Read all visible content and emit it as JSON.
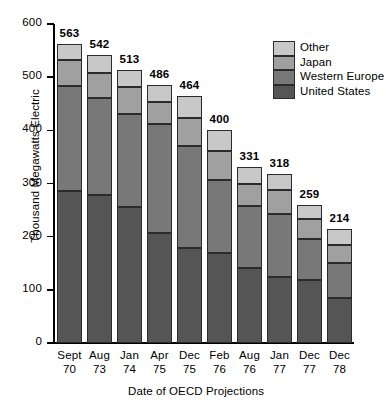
{
  "chart_data": {
    "type": "bar",
    "subtype": "stacked-vertical",
    "title": "",
    "xlabel": "Date of OECD Projections",
    "ylabel": "Thousand Megawatts Electric",
    "ylim": [
      0,
      600
    ],
    "yticks": [
      0,
      100,
      200,
      300,
      400,
      500,
      600
    ],
    "ytick_labels": [
      "0",
      "100",
      "200",
      "300",
      "400",
      "500",
      "600"
    ],
    "grid": false,
    "legend_position": "upper-right",
    "categories": [
      "Sept 70",
      "Aug 73",
      "Jan 74",
      "Apr 75",
      "Dec 75",
      "Feb 76",
      "Aug 76",
      "Jan 77",
      "Dec 77",
      "Dec 78"
    ],
    "category_lines": [
      [
        "Sept",
        "70"
      ],
      [
        "Aug",
        "73"
      ],
      [
        "Jan",
        "74"
      ],
      [
        "Apr",
        "75"
      ],
      [
        "Dec",
        "75"
      ],
      [
        "Feb",
        "76"
      ],
      [
        "Aug",
        "76"
      ],
      [
        "Jan",
        "77"
      ],
      [
        "Dec",
        "77"
      ],
      [
        "Dec",
        "78"
      ]
    ],
    "totals": [
      563,
      542,
      513,
      486,
      464,
      400,
      331,
      318,
      259,
      214
    ],
    "total_labels": [
      "563",
      "542",
      "513",
      "486",
      "464",
      "400",
      "331",
      "318",
      "259",
      "214"
    ],
    "series": [
      {
        "name": "United States",
        "color": "#555555",
        "values": [
          285,
          278,
          255,
          207,
          178,
          169,
          141,
          124,
          118,
          84
        ]
      },
      {
        "name": "Western Europe",
        "color": "#787878",
        "values": [
          198,
          183,
          175,
          205,
          193,
          137,
          116,
          119,
          78,
          66
        ]
      },
      {
        "name": "Japan",
        "color": "#a0a0a0",
        "values": [
          49,
          47,
          51,
          42,
          53,
          56,
          43,
          45,
          37,
          34
        ]
      },
      {
        "name": "Other",
        "color": "#c8c8c8",
        "values": [
          31,
          34,
          32,
          32,
          40,
          38,
          31,
          30,
          26,
          30
        ]
      }
    ],
    "legend_entries": [
      {
        "label": "Other",
        "color": "#c8c8c8"
      },
      {
        "label": "Japan",
        "color": "#a0a0a0"
      },
      {
        "label": "Western Europe",
        "color": "#787878"
      },
      {
        "label": "United States",
        "color": "#555555"
      }
    ]
  }
}
